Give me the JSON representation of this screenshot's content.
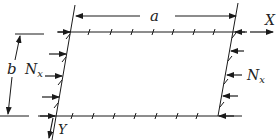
{
  "diagram": {
    "labels": {
      "width": "a",
      "height": "b",
      "x_axis": "X",
      "y_axis": "Y",
      "load_left": "N",
      "load_left_sub": "x",
      "load_right": "N",
      "load_right_sub": "x"
    },
    "colors": {
      "stroke": "#1a1a1a",
      "background": "#ffffff"
    }
  }
}
